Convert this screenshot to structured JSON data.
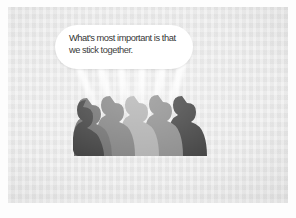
{
  "image": {
    "type": "illustration",
    "medium": "scanned-halftone-print",
    "width": 296,
    "height": 218,
    "page_background": "#ffffff",
    "panel_background": "#e9e9e9",
    "subject": "crowd of six human silhouettes in profile with a speech bubble"
  },
  "speech_bubble": {
    "shape": "rounded-rectangle",
    "fill": "#ffffff",
    "text_color": "#242424",
    "line1": "What's most important is that",
    "line2": "we stick together.",
    "full_text": "What's most important is that\nwe stick together."
  },
  "rays": {
    "color": "#ffffff",
    "count": 6,
    "description": "white light beams fanning upward from each head toward the bubble"
  },
  "crowd": {
    "count": 6,
    "facing": "left",
    "base_color": "#5a5a5a",
    "figures": [
      {
        "name": "figure-1",
        "fill": "#3a3a3a"
      },
      {
        "name": "figure-2",
        "fill": "#6b6b6b"
      },
      {
        "name": "figure-3",
        "fill": "#7e7e7e"
      },
      {
        "name": "figure-4",
        "fill": "#adadad"
      },
      {
        "name": "figure-5",
        "fill": "#8a8a8a"
      },
      {
        "name": "figure-6",
        "fill": "#3f3f3f"
      }
    ],
    "platform": {
      "name": "platform",
      "fill": "#4a4a4a"
    }
  }
}
